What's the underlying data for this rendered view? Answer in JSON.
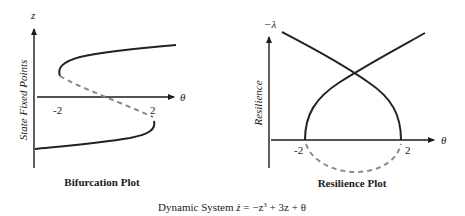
{
  "bifurcation_plot": {
    "title": "Bifurcation Plot",
    "y_axis_label": "State Fixed Points",
    "y_axis_symbol": "z",
    "x_axis_symbol": "θ",
    "x_ticks": [
      "-2",
      "2"
    ],
    "branches": [
      {
        "name": "upper-stable-branch",
        "style": "solid"
      },
      {
        "name": "middle-unstable-branch",
        "style": "dashed"
      },
      {
        "name": "lower-stable-branch",
        "style": "solid"
      }
    ]
  },
  "resilience_plot": {
    "title": "Resilience Plot",
    "y_axis_label": "Resilience",
    "y_axis_symbol": "−λ",
    "x_axis_symbol": "θ",
    "x_ticks": [
      "-2",
      "2"
    ],
    "branches": [
      {
        "name": "rising-branch",
        "style": "solid"
      },
      {
        "name": "falling-branch",
        "style": "solid"
      },
      {
        "name": "negative-resilience-branch",
        "style": "dashed"
      }
    ]
  },
  "caption": {
    "prefix": "Dynamic System ",
    "z_dot": "ż",
    "equation_eq": " = −z",
    "exponent": "3",
    "equation_rest": " + 3z + θ"
  },
  "colors": {
    "axis": "#1a1a1a",
    "solid_curve": "#222222",
    "dashed_curve": "#8a8a8a"
  }
}
